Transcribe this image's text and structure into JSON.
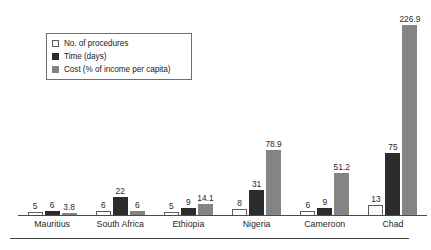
{
  "chart_data": {
    "type": "bar",
    "title": "",
    "subtitle": "",
    "xlabel": "",
    "ylabel": "",
    "grid": false,
    "legend_position": "top-left",
    "axis_visible": "x-only",
    "ylim": [
      0,
      240
    ],
    "categories": [
      "Mauritius",
      "South Africa",
      "Ethiopia",
      "Nigeria",
      "Cameroon",
      "Chad"
    ],
    "series": [
      {
        "name": "No. of procedures",
        "color": "#fbfbfb",
        "values": [
          5,
          6,
          5,
          8,
          6,
          13
        ],
        "labels": [
          "5",
          "6",
          "5",
          "8",
          "6",
          "13"
        ]
      },
      {
        "name": "Time (days)",
        "color": "#2b2b2b",
        "values": [
          6,
          22,
          9,
          31,
          9,
          75
        ],
        "labels": [
          "6",
          "22",
          "9",
          "31",
          "9",
          "75"
        ]
      },
      {
        "name": "Cost (% of income per capita)",
        "color": "#848484",
        "values": [
          3.8,
          6,
          14.1,
          78.9,
          51.2,
          226.9
        ],
        "labels": [
          "3.8",
          "6",
          "14.1",
          "78.9",
          "51.2",
          "226.9"
        ]
      }
    ]
  },
  "legend": {
    "items": [
      {
        "label": "No. of procedures",
        "swatch": "white-outlined-square"
      },
      {
        "label": "Time (days)",
        "swatch": "black-filled-square"
      },
      {
        "label": "Cost (% of income per capita)",
        "swatch": "gray-filled-square"
      }
    ]
  },
  "colors": {
    "series_procedures": "#fbfbfb",
    "series_time": "#2b2b2b",
    "series_cost": "#848484",
    "axis": "#4a4a4a",
    "text": "#1a1a1a",
    "background": "#ffffff"
  }
}
